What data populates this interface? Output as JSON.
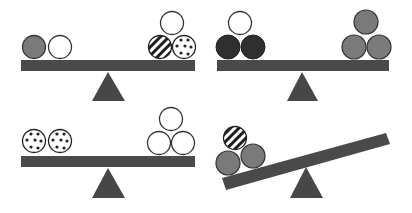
{
  "colors": {
    "background": "#ffffff",
    "beam": "#4a4a4a",
    "fulcrum": "#474747",
    "outline": "#333333",
    "dark_ball": "#2f2f2f",
    "gray_ball": "#7a7a7a",
    "white_ball": "#ffffff"
  },
  "panels": [
    {
      "id": "panel-1",
      "state": "balanced",
      "left_pan": [
        "gray",
        "white"
      ],
      "right_pan": [
        "white",
        "striped",
        "dotted"
      ]
    },
    {
      "id": "panel-2",
      "state": "balanced",
      "left_pan": [
        "white",
        "dark",
        "dark"
      ],
      "right_pan": [
        "gray",
        "gray",
        "gray"
      ]
    },
    {
      "id": "panel-3",
      "state": "balanced",
      "left_pan": [
        "dotted",
        "dotted"
      ],
      "right_pan": [
        "white",
        "white",
        "white"
      ]
    },
    {
      "id": "panel-4",
      "state": "tilted-left",
      "left_pan": [
        "striped",
        "gray",
        "gray"
      ],
      "right_pan": []
    }
  ]
}
